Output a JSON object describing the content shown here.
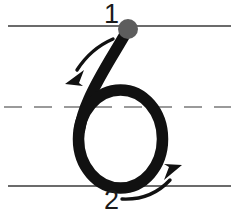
{
  "worksheet": {
    "title": "Handwriting stroke-order guide for the numeral 6",
    "glyph": "6",
    "width": 231,
    "height": 216,
    "background_color": "#ffffff"
  },
  "guidelines": {
    "top_line": {
      "name": "top-line",
      "style": "solid",
      "color": "#6b6b6b",
      "y": 26,
      "x_start": 8,
      "x_end": 231,
      "thickness": 2
    },
    "middle_line": {
      "name": "middle-dashed-line",
      "style": "dashed",
      "color": "#9a9a9a",
      "y": 107,
      "x_start": 4,
      "x_end": 231,
      "thickness": 2,
      "dash_length": 18,
      "dash_gap": 12
    },
    "bottom_line": {
      "name": "bottom-line",
      "style": "solid",
      "color": "#6b6b6b",
      "y": 186,
      "x_start": 8,
      "x_end": 231,
      "thickness": 2
    }
  },
  "numeral": {
    "name": "numeral-six",
    "color": "#111111",
    "stroke_width": 11
  },
  "start_dot": {
    "name": "start-dot",
    "color": "#5d5d5d",
    "cx": 128,
    "cy": 29,
    "r": 10
  },
  "strokes": [
    {
      "order": "1",
      "label": "1",
      "label_x": 104,
      "label_y": 1,
      "direction": "down-left",
      "arrow_color": "#111111",
      "description": "Start at the dot on the top line and pull down and to the left"
    },
    {
      "order": "2",
      "label": "2",
      "label_x": 104,
      "label_y": 187,
      "direction": "up-right",
      "arrow_color": "#111111",
      "description": "Curve around the bottom loop and back up to the right"
    }
  ]
}
